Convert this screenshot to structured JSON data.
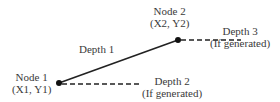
{
  "diagram": {
    "nodes": [
      {
        "id": "node1",
        "label": "Node 1",
        "coords": "(X1, Y1)",
        "x": 59,
        "y": 83
      },
      {
        "id": "node2",
        "label": "Node 2",
        "coords": "(X2, Y2)",
        "x": 178,
        "y": 40
      }
    ],
    "edges": [
      {
        "id": "depth1",
        "label": "Depth 1",
        "style": "solid",
        "from": "node1",
        "to": "node2"
      },
      {
        "id": "depth2",
        "label": "Depth 2",
        "sublabel": "(If generated)",
        "style": "dashed",
        "from": "node1"
      },
      {
        "id": "depth3",
        "label": "Depth 3",
        "sublabel": "(If generated)",
        "style": "dashed",
        "from": "node2"
      }
    ],
    "colors": {
      "line": "#222222",
      "text": "#3a3a3a",
      "background": "#ffffff"
    }
  }
}
